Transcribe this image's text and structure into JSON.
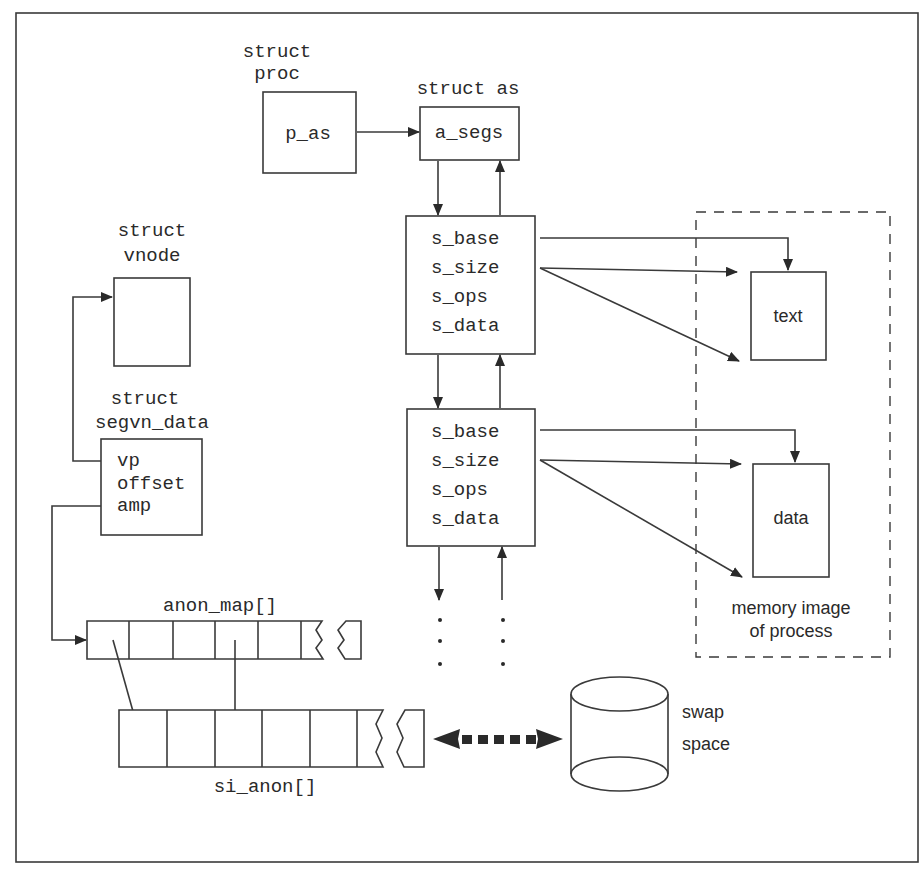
{
  "diagram": {
    "proc": {
      "title1": "struct",
      "title2": "proc",
      "field": "p_as"
    },
    "as": {
      "title": "struct as",
      "field": "a_segs"
    },
    "vnode": {
      "title1": "struct",
      "title2": "vnode"
    },
    "segvn": {
      "title1": "struct",
      "title2": "segvn_data",
      "fields": [
        "vp",
        "offset",
        "amp"
      ]
    },
    "seg1": {
      "fields": [
        "s_base",
        "s_size",
        "s_ops",
        "s_data"
      ]
    },
    "seg2": {
      "fields": [
        "s_base",
        "s_size",
        "s_ops",
        "s_data"
      ]
    },
    "text_box": {
      "label": "text"
    },
    "data_box": {
      "label": "data"
    },
    "memory_image": {
      "line1": "memory image",
      "line2": "of process"
    },
    "anon_map": {
      "label": "anon_map[]"
    },
    "si_anon": {
      "label": "si_anon[]"
    },
    "swap": {
      "line1": "swap",
      "line2": "space"
    }
  }
}
